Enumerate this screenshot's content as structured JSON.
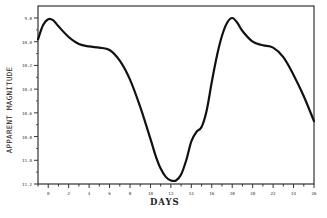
{
  "chart_data": {
    "type": "line",
    "title": "",
    "xlabel": "DAYS",
    "ylabel": "APPARENT MAGNITUDE",
    "xlim": [
      -1,
      26
    ],
    "ylim": [
      11.2,
      9.7
    ],
    "y_inverted": true,
    "grid": false,
    "legend": null,
    "x_ticks": [
      0,
      2,
      4,
      6,
      8,
      10,
      12,
      14,
      16,
      18,
      20,
      22,
      24,
      26
    ],
    "y_ticks": [
      9.8,
      10.0,
      10.2,
      10.4,
      10.6,
      10.8,
      11.0,
      11.2
    ],
    "series": [
      {
        "name": "light curve",
        "color": "#111111",
        "x": [
          -1.0,
          -0.5,
          0.0,
          0.5,
          1.0,
          2.0,
          3.0,
          4.0,
          5.0,
          6.0,
          7.0,
          8.0,
          9.0,
          10.0,
          10.5,
          11.0,
          11.5,
          12.0,
          12.5,
          13.0,
          13.5,
          14.0,
          14.5,
          15.0,
          15.5,
          16.0,
          16.5,
          17.0,
          17.5,
          18.0,
          18.5,
          19.0,
          20.0,
          21.0,
          22.0,
          23.0,
          24.0,
          25.0,
          26.0
        ],
        "y": [
          9.98,
          9.86,
          9.81,
          9.82,
          9.87,
          9.96,
          10.02,
          10.04,
          10.05,
          10.07,
          10.16,
          10.32,
          10.55,
          10.82,
          10.96,
          11.07,
          11.14,
          11.17,
          11.17,
          11.12,
          11.0,
          10.84,
          10.76,
          10.72,
          10.58,
          10.34,
          10.12,
          9.95,
          9.84,
          9.8,
          9.84,
          9.91,
          10.0,
          10.03,
          10.05,
          10.13,
          10.28,
          10.46,
          10.67
        ]
      }
    ]
  },
  "axes": {
    "xlabel": "DAYS",
    "ylabel": "APPARENT MAGNITUDE"
  }
}
